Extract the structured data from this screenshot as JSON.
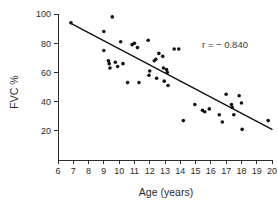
{
  "chart_data": {
    "type": "scatter",
    "title": "",
    "xlabel": "Age (years)",
    "ylabel": "FVC %",
    "xlim": [
      6,
      20
    ],
    "ylim": [
      0,
      100
    ],
    "xticks": [
      6,
      7,
      8,
      9,
      10,
      11,
      12,
      13,
      14,
      15,
      16,
      17,
      18,
      19,
      20
    ],
    "yticks": [
      20,
      40,
      60,
      80,
      100
    ],
    "xtick_labels": [
      "6",
      "7",
      "8",
      "9",
      "10",
      "11",
      "12",
      "13",
      "14",
      "15",
      "16",
      "17",
      "18",
      "19",
      "20"
    ],
    "ytick_labels": [
      "20",
      "40",
      "60",
      "80",
      "100"
    ],
    "grid": false,
    "legend": null,
    "annotations": [
      {
        "text": "r = − 0.840",
        "x": 17.4,
        "y": 81
      }
    ],
    "correlation": -0.84,
    "marker": {
      "shape": "circle",
      "color": "#111111",
      "size": 3.6
    },
    "trendline": {
      "type": "linear",
      "color": "#111111",
      "x_start": 6.78,
      "y_start": 94.0,
      "x_end": 20.0,
      "y_end": 21.0
    },
    "points": [
      {
        "x": 6.85,
        "y": 94
      },
      {
        "x": 9.0,
        "y": 88
      },
      {
        "x": 9.55,
        "y": 98
      },
      {
        "x": 9.0,
        "y": 75
      },
      {
        "x": 9.3,
        "y": 68
      },
      {
        "x": 9.35,
        "y": 66
      },
      {
        "x": 9.4,
        "y": 63
      },
      {
        "x": 9.75,
        "y": 67
      },
      {
        "x": 9.9,
        "y": 64
      },
      {
        "x": 10.1,
        "y": 81
      },
      {
        "x": 10.25,
        "y": 66
      },
      {
        "x": 10.55,
        "y": 53
      },
      {
        "x": 10.85,
        "y": 79
      },
      {
        "x": 11.0,
        "y": 80
      },
      {
        "x": 11.2,
        "y": 77
      },
      {
        "x": 11.3,
        "y": 53
      },
      {
        "x": 11.9,
        "y": 82
      },
      {
        "x": 11.95,
        "y": 58
      },
      {
        "x": 12.0,
        "y": 61
      },
      {
        "x": 12.3,
        "y": 68
      },
      {
        "x": 12.4,
        "y": 69
      },
      {
        "x": 12.45,
        "y": 56
      },
      {
        "x": 12.6,
        "y": 73
      },
      {
        "x": 12.85,
        "y": 71
      },
      {
        "x": 12.9,
        "y": 63
      },
      {
        "x": 12.95,
        "y": 54
      },
      {
        "x": 13.1,
        "y": 62
      },
      {
        "x": 13.15,
        "y": 60
      },
      {
        "x": 13.2,
        "y": 51
      },
      {
        "x": 13.6,
        "y": 76
      },
      {
        "x": 13.9,
        "y": 76
      },
      {
        "x": 14.2,
        "y": 27
      },
      {
        "x": 14.95,
        "y": 38
      },
      {
        "x": 15.45,
        "y": 34
      },
      {
        "x": 15.6,
        "y": 33
      },
      {
        "x": 15.9,
        "y": 35
      },
      {
        "x": 16.55,
        "y": 31
      },
      {
        "x": 16.75,
        "y": 26
      },
      {
        "x": 17.0,
        "y": 45
      },
      {
        "x": 17.35,
        "y": 38
      },
      {
        "x": 17.4,
        "y": 36
      },
      {
        "x": 17.5,
        "y": 31
      },
      {
        "x": 17.85,
        "y": 44
      },
      {
        "x": 18.0,
        "y": 39
      },
      {
        "x": 18.05,
        "y": 21
      },
      {
        "x": 19.75,
        "y": 27
      }
    ]
  },
  "caption": {
    "partial_text": ""
  }
}
